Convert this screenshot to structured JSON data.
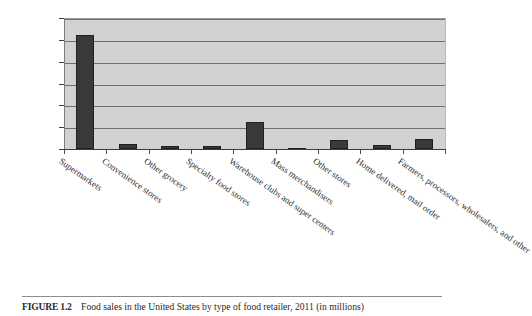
{
  "figure": {
    "caption_label": "FIGURE 1.2",
    "caption_text": "Food sales in the United States by type of food retailer, 2011 (in millions)"
  },
  "colors": {
    "bar_fill": "#3a3a3a",
    "plot_background": "#d2d2d2",
    "gridline": "#6f6f6f",
    "axis": "#3b3b3b"
  },
  "chart_data": {
    "type": "bar",
    "title": "Food sales in the United States by type of food retailer, 2011 (in millions)",
    "xlabel": "",
    "ylabel": "",
    "ylim": [
      0,
      600000
    ],
    "grid": true,
    "legend": "none",
    "ytick_labels": [
      "$600, 000",
      "$500, 000",
      "$400, 000",
      "$300, 000",
      "$200, 000",
      "$100, 000",
      "$0"
    ],
    "ytick_values": [
      600000,
      500000,
      400000,
      300000,
      200000,
      100000,
      0
    ],
    "categories": [
      "Supermarkets",
      "Convenience stores",
      "Other grocery",
      "Specialty food stores",
      "Warehouse clubs and super centers",
      "Mass merchandisers",
      "Other stores",
      "Home delivered, mail order",
      "Farmers, processors, wholesalers, and other"
    ],
    "values": [
      520000,
      22000,
      16000,
      14000,
      125000,
      4000,
      42000,
      18000,
      45000
    ]
  }
}
